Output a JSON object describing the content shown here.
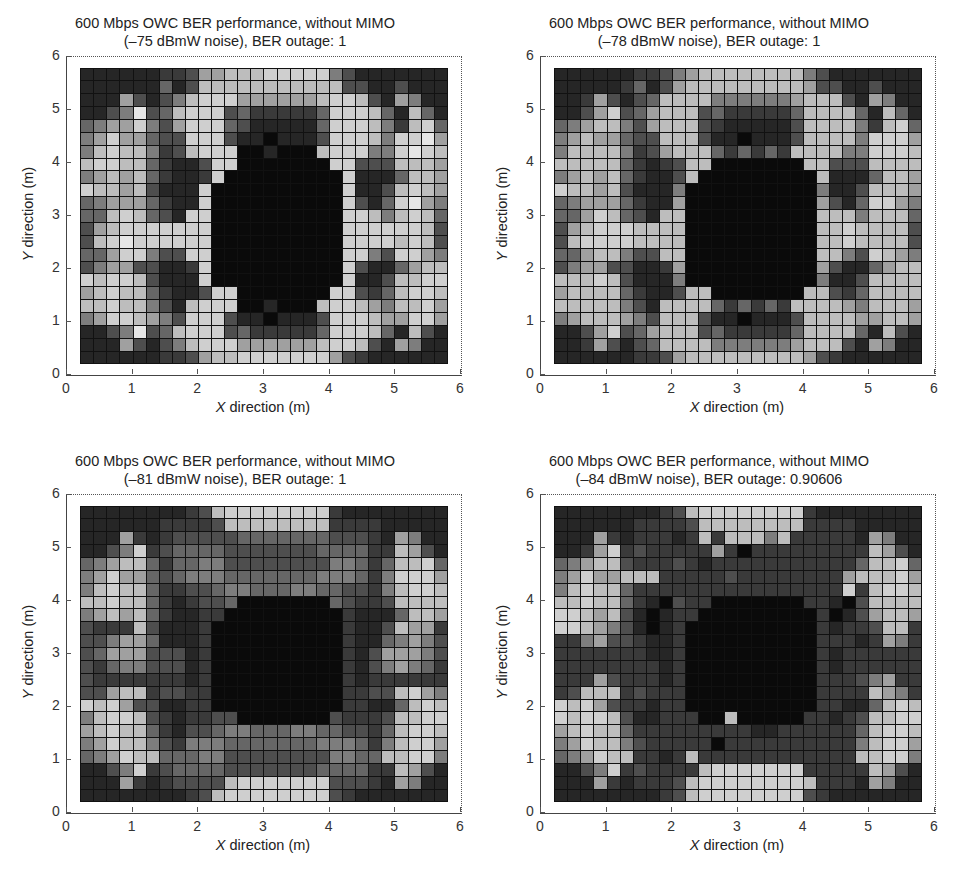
{
  "chart_data": [
    {
      "type": "heatmap",
      "title": "600 Mbps OWC BER performance, without MIMO (–75 dBmW noise), BER outage: 1",
      "title_line1": "600 Mbps OWC BER performance, without MIMO",
      "title_line2": "(–75 dBmW noise), BER outage: 1",
      "noise_dBmW": -75,
      "ber_outage": 1,
      "xlabel_var": "X",
      "xlabel_rest": " direction (m)",
      "ylabel_var": "Y",
      "ylabel_rest": " direction (m)",
      "xlim": [
        0,
        6
      ],
      "ylim": [
        0,
        6
      ],
      "xticks": [
        "0",
        "1",
        "2",
        "3",
        "4",
        "5",
        "6"
      ],
      "yticks": [
        "0",
        "1",
        "2",
        "3",
        "4",
        "5",
        "6"
      ],
      "grid": true,
      "colormap": "grayscale (dark = high BER, light = low BER)",
      "rows": 23,
      "cols": 28,
      "levels": [
        "1111112236677788888531111111",
        "1111114137777777777733113111",
        "1116313578886666667887316511",
        "1135934788834222224888741741",
        "4566853688843111114888752784",
        "5686643388831101113888758896",
        "5787752378880010007888558987",
        "7887742113880000000883337776",
        "5676742112800000000081114776",
        "8776731118000000000081137876",
        "4566642118000000000083148965",
        "4478743188000000000088757874",
        "3678888888000000000088888873",
        "3789888888000000000088887873",
        "4468853388000000000088538865",
        "3566331128000000000083114677",
        "8788731118000000000081137788",
        "6787742113880000000883247887",
        "7787753178880010007887657786",
        "5688765388831101113888766886",
        "1135934788834222224888741731",
        "1116313578886666667887316511",
        "1111112236778888888632111111"
      ]
    },
    {
      "type": "heatmap",
      "title": "600 Mbps OWC BER performance, without MIMO (–78 dBmW noise), BER outage: 1",
      "title_line1": "600 Mbps OWC BER performance, without MIMO",
      "title_line2": "(–78 dBmW noise), BER outage: 1",
      "noise_dBmW": -78,
      "ber_outage": 1,
      "xlabel_var": "X",
      "xlabel_rest": " direction (m)",
      "ylabel_var": "Y",
      "ylabel_rest": " direction (m)",
      "xlim": [
        0,
        6
      ],
      "ylim": [
        0,
        6
      ],
      "xticks": [
        "0",
        "1",
        "2",
        "3",
        "4",
        "5",
        "6"
      ],
      "yticks": [
        "0",
        "1",
        "2",
        "3",
        "4",
        "5",
        "6"
      ],
      "grid": true,
      "colormap": "grayscale",
      "rows": 23,
      "cols": 28,
      "levels": [
        "1111112235677777777531111111",
        "1111124136777777777633113111",
        "1126313477775555556777316511",
        "1136834677734222224777741741",
        "4567753677732111113777752784",
        "5676643377731101113777758886",
        "5777752367774242427777558887",
        "7777742123770000000773337777",
        "5676742113700000000071114776",
        "8776731115000000000051137776",
        "4566642116000000000063148865",
        "4468743177000000000077757774",
        "3678887777000000000077877773",
        "3788887777000000000077877773",
        "4467753377000000000077538765",
        "3566331126000000000063114677",
        "7778731115000000000051137777",
        "6777742113770000000773247777",
        "7777753177774242427777657776",
        "5677765377731101113777766776",
        "1136834677734222224777741731",
        "1126313477775555556777316511",
        "1111112236777777777632111111"
      ]
    },
    {
      "type": "heatmap",
      "title": "600 Mbps OWC BER performance, without MIMO (–81 dBmW noise), BER outage: 1",
      "title_line1": "600 Mbps OWC BER performance, without MIMO",
      "title_line2": "(–81 dBmW noise), BER outage: 1",
      "noise_dBmW": -81,
      "ber_outage": 1,
      "xlabel_var": "X",
      "xlabel_rest": " direction (m)",
      "ylabel_var": "Y",
      "ylabel_rest": " direction (m)",
      "xlim": [
        0,
        6
      ],
      "ylim": [
        0,
        6
      ],
      "xticks": [
        "0",
        "1",
        "2",
        "3",
        "4",
        "5",
        "6"
      ],
      "yticks": [
        "0",
        "1",
        "2",
        "3",
        "4",
        "5",
        "6"
      ],
      "grid": true,
      "colormap": "grayscale",
      "rows": 23,
      "cols": 28,
      "levels": [
        "1111111123788888888211111111",
        "1111112222377777777222211111",
        "1116212333334444444333216511",
        "1135823444433333334444227631",
        "4567742445533333333554247784",
        "5686643455544444445554258886",
        "5787742233455444554433257887",
        "7787742123340000000432237777",
        "5676742112200000000021114776",
        "3222731112000000000021137662",
        "3356641112000000000021145653",
        "3466633312000000000021366653",
        "3245533312000000000021356542",
        "3222222212000000000021222222",
        "3367723322000000000022337865",
        "8786331122000000000022114787",
        "5788732122330000000322237788",
        "6787742133455444554433247887",
        "5687753255544444445554257886",
        "4568774445533333333554477885",
        "1135823444433333334444227631",
        "1116212333378888888333216511",
        "1111111123788888888321111111"
      ]
    },
    {
      "type": "heatmap",
      "title": "600 Mbps OWC BER performance, without MIMO (–84 dBmW noise), BER outage: 0.90606",
      "title_line1": "600 Mbps OWC BER performance, without MIMO",
      "title_line2": "(–84 dBmW noise), BER outage: 0.90606",
      "noise_dBmW": -84,
      "ber_outage": 0.90606,
      "xlabel_var": "X",
      "xlabel_rest": " direction (m)",
      "ylabel_var": "Y",
      "ylabel_rest": " direction (m)",
      "xlim": [
        0,
        6
      ],
      "ylim": [
        0,
        6
      ],
      "xticks": [
        "0",
        "1",
        "2",
        "3",
        "4",
        "5",
        "6"
      ],
      "yticks": [
        "0",
        "1",
        "2",
        "3",
        "4",
        "5",
        "6"
      ],
      "grid": true,
      "colormap": "grayscale",
      "rows": 23,
      "cols": 28,
      "levels": [
        "1111111123788888888211111111",
        "1111112222377777777222211111",
        "1116212221272777572222216511",
        "1126823222226202222222227631",
        "4567732223212222222222247784",
        "5686677722222322222222677786",
        "5787742222222222222222827887",
        "7787742103220000000221037777",
        "8876731012200000000020136776",
        "8876531012000000000021223772",
        "2256332112000000000022212652",
        "2222222112000000000021222222",
        "2222222212000000000021222222",
        "2226322212000000000022235622",
        "2377723222000000000022227652",
        "8786322122000000000022114787",
        "8788731122200700000221237788",
        "6787742222222221122222247887",
        "5687753222220222222222257886",
        "4568772212722222222222277885",
        "1135823222278888888222227631",
        "1116212223788888888722216511",
        "1111111123788888888321111111"
      ]
    }
  ]
}
